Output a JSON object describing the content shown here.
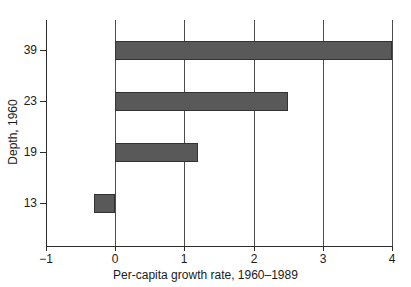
{
  "chart_data": {
    "type": "bar",
    "orientation": "horizontal",
    "title": "",
    "xlabel": "Per-capita growth rate, 1960–1989",
    "ylabel": "Depth, 1960",
    "categories": [
      "13",
      "19",
      "23",
      "39"
    ],
    "values": [
      -0.3,
      1.2,
      2.5,
      4.0
    ],
    "xlim": [
      -1,
      4
    ],
    "xticks": [
      "−1",
      "0",
      "1",
      "2",
      "3",
      "4"
    ],
    "xtick_values": [
      -1,
      0,
      1,
      2,
      3,
      4
    ],
    "yticks": [
      "39",
      "23",
      "19",
      "13"
    ],
    "grid": "vertical",
    "legend": "none",
    "bar_color": "#595959",
    "bar_edge_color": "#333333",
    "axis_color": "#2b2b2b",
    "background": "#ffffff"
  }
}
